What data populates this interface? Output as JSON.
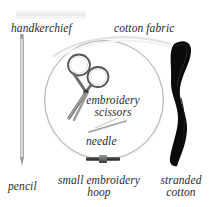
{
  "image": {
    "kind": "annotated-photograph",
    "subject": "embroidery starter equipment",
    "background_color": "#ffffff",
    "label_color": "#2b2b2b"
  },
  "labels": {
    "handkerchief": "handkerchief",
    "cotton_fabric": "cotton fabric",
    "embroidery_scissors": "embroidery scissors",
    "needle": "needle",
    "pencil": "pencil",
    "small_embroidery_hoop": "small embroidery hoop",
    "stranded_cotton": "stranded cotton"
  },
  "objects": {
    "handkerchief": {
      "name": "handkerchief",
      "color": "#f0f0f0"
    },
    "cotton_fabric": {
      "name": "cotton fabric",
      "color": "#fafafa"
    },
    "pencil": {
      "name": "pencil",
      "color": "#b0b0b0"
    },
    "embroidery_hoop": {
      "name": "small embroidery hoop",
      "color": "#b4b4b4"
    },
    "embroidery_scissors": {
      "name": "embroidery scissors",
      "color": "#6b6b6b"
    },
    "needle": {
      "name": "needle",
      "color": "#9c9c9c"
    },
    "stranded_cotton": {
      "name": "stranded cotton",
      "color": "#0a0a0a"
    }
  }
}
